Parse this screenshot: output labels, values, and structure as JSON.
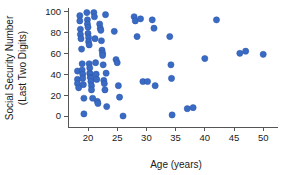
{
  "chart_data": {
    "type": "scatter",
    "title": "",
    "xlabel": "Age (years)",
    "ylabel": "Social Security Number (Last Two Digits)",
    "ylabel_line1": "Social Security Number",
    "ylabel_line2": "(Last Two Digits)",
    "xlim": [
      17.0,
      51.5
    ],
    "ylim": [
      -5,
      103
    ],
    "xticks": [
      20,
      25,
      30,
      35,
      40,
      45,
      50
    ],
    "yticks": [
      0,
      20,
      40,
      60,
      80,
      100
    ],
    "xtick_labels": [
      "20",
      "25",
      "30",
      "35",
      "40",
      "45",
      "50"
    ],
    "ytick_labels": [
      "0",
      "20",
      "40",
      "60",
      "80",
      "100"
    ],
    "grid": false,
    "legend": null,
    "marker_color": "#3a6bc4",
    "marker_edge_color": "#2a55a8",
    "marker_size": 3.1,
    "points": [
      {
        "x": 18.2,
        "y": 43
      },
      {
        "x": 18.2,
        "y": 35
      },
      {
        "x": 18.2,
        "y": 31
      },
      {
        "x": 18.4,
        "y": 27
      },
      {
        "x": 18.6,
        "y": 96
      },
      {
        "x": 18.6,
        "y": 91
      },
      {
        "x": 18.7,
        "y": 83
      },
      {
        "x": 18.7,
        "y": 78
      },
      {
        "x": 18.8,
        "y": 74
      },
      {
        "x": 18.9,
        "y": 64
      },
      {
        "x": 19.0,
        "y": 50
      },
      {
        "x": 19.0,
        "y": 44
      },
      {
        "x": 19.1,
        "y": 40
      },
      {
        "x": 19.1,
        "y": 36
      },
      {
        "x": 19.2,
        "y": 30
      },
      {
        "x": 19.3,
        "y": 17
      },
      {
        "x": 19.3,
        "y": 2
      },
      {
        "x": 19.8,
        "y": 99
      },
      {
        "x": 19.9,
        "y": 92
      },
      {
        "x": 19.9,
        "y": 88
      },
      {
        "x": 20.0,
        "y": 85
      },
      {
        "x": 20.0,
        "y": 79
      },
      {
        "x": 20.1,
        "y": 75
      },
      {
        "x": 20.1,
        "y": 71
      },
      {
        "x": 20.2,
        "y": 68
      },
      {
        "x": 20.2,
        "y": 50
      },
      {
        "x": 20.3,
        "y": 46
      },
      {
        "x": 20.3,
        "y": 41
      },
      {
        "x": 20.4,
        "y": 40
      },
      {
        "x": 20.4,
        "y": 37
      },
      {
        "x": 20.5,
        "y": 36
      },
      {
        "x": 20.5,
        "y": 33
      },
      {
        "x": 20.6,
        "y": 29
      },
      {
        "x": 20.6,
        "y": 25
      },
      {
        "x": 20.8,
        "y": 17
      },
      {
        "x": 21.0,
        "y": 99
      },
      {
        "x": 21.1,
        "y": 95
      },
      {
        "x": 21.2,
        "y": 74
      },
      {
        "x": 21.3,
        "y": 51
      },
      {
        "x": 21.4,
        "y": 40
      },
      {
        "x": 21.5,
        "y": 35
      },
      {
        "x": 21.6,
        "y": 14
      },
      {
        "x": 21.7,
        "y": 12
      },
      {
        "x": 22.0,
        "y": 88
      },
      {
        "x": 22.1,
        "y": 84
      },
      {
        "x": 22.2,
        "y": 82
      },
      {
        "x": 22.3,
        "y": 72
      },
      {
        "x": 22.4,
        "y": 63
      },
      {
        "x": 22.5,
        "y": 60
      },
      {
        "x": 22.5,
        "y": 58
      },
      {
        "x": 22.6,
        "y": 49
      },
      {
        "x": 22.7,
        "y": 34
      },
      {
        "x": 22.8,
        "y": 31
      },
      {
        "x": 22.9,
        "y": 25
      },
      {
        "x": 23.0,
        "y": 97
      },
      {
        "x": 23.1,
        "y": 41
      },
      {
        "x": 23.2,
        "y": 9
      },
      {
        "x": 24.5,
        "y": 81
      },
      {
        "x": 24.8,
        "y": 54
      },
      {
        "x": 25.0,
        "y": 51
      },
      {
        "x": 25.2,
        "y": 29
      },
      {
        "x": 25.4,
        "y": 18
      },
      {
        "x": 26.0,
        "y": 0
      },
      {
        "x": 27.9,
        "y": 95
      },
      {
        "x": 28.1,
        "y": 91
      },
      {
        "x": 28.4,
        "y": 76
      },
      {
        "x": 29.0,
        "y": 93
      },
      {
        "x": 29.4,
        "y": 33
      },
      {
        "x": 30.2,
        "y": 33
      },
      {
        "x": 31.0,
        "y": 92
      },
      {
        "x": 31.3,
        "y": 84
      },
      {
        "x": 31.5,
        "y": 29
      },
      {
        "x": 34.0,
        "y": 76
      },
      {
        "x": 34.2,
        "y": 49
      },
      {
        "x": 34.3,
        "y": 36
      },
      {
        "x": 34.4,
        "y": 1
      },
      {
        "x": 37.0,
        "y": 7
      },
      {
        "x": 38.0,
        "y": 8
      },
      {
        "x": 40.0,
        "y": 55
      },
      {
        "x": 42.0,
        "y": 92
      },
      {
        "x": 46.0,
        "y": 60
      },
      {
        "x": 47.0,
        "y": 62
      },
      {
        "x": 50.0,
        "y": 59
      }
    ]
  }
}
